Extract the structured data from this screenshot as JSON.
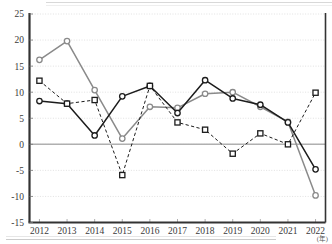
{
  "chart_data": {
    "type": "line",
    "title": "",
    "xlabel": "(年)",
    "ylabel": "",
    "categories": [
      "2012",
      "2013",
      "2014",
      "2015",
      "2016",
      "2017",
      "2018",
      "2019",
      "2020",
      "2021",
      "2022"
    ],
    "x_tick_labels": [
      "2012",
      "2013",
      "2014",
      "2015",
      "2016",
      "2017",
      "2018",
      "2019",
      "2020",
      "2021",
      "2022"
    ],
    "y_tick_labels": [
      "25",
      "20",
      "15",
      "10",
      "5",
      "0",
      "-5",
      "-10",
      "-15"
    ],
    "y_ticks": [
      25,
      20,
      15,
      10,
      5,
      0,
      -5,
      -10,
      -15
    ],
    "ylim": [
      -15,
      25
    ],
    "grid": true,
    "grid_axis": "y",
    "legend": "none",
    "zero_line": 0,
    "series": [
      {
        "name": "series-gray-circle",
        "marker": "circle",
        "line_style": "solid",
        "color": "#8a8a8a",
        "values": [
          16.2,
          19.8,
          10.4,
          1.1,
          7.2,
          7.0,
          9.7,
          10.0,
          7.2,
          4.3,
          -9.8
        ]
      },
      {
        "name": "series-black-circle",
        "marker": "circle",
        "line_style": "solid",
        "color": "#1c1c1c",
        "values": [
          8.3,
          7.8,
          1.7,
          9.2,
          11.2,
          6.0,
          12.3,
          8.8,
          7.6,
          4.2,
          -4.8
        ]
      },
      {
        "name": "series-black-square-dashed",
        "marker": "square",
        "line_style": "dashed",
        "color": "#1c1c1c",
        "values": [
          12.2,
          7.8,
          8.5,
          -5.9,
          11.2,
          4.2,
          2.8,
          -1.8,
          2.1,
          0.0,
          9.9
        ]
      }
    ]
  },
  "axis": {
    "unit_note": "(年)"
  },
  "colors": {
    "gray_series": "#8a8a8a",
    "black_series": "#1c1c1c",
    "grid": "#d9d9d9",
    "axis": "#333333",
    "zero_line": "#b0b0b0",
    "background": "#ffffff"
  }
}
